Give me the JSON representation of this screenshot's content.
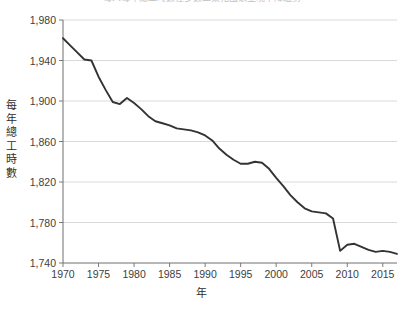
{
  "chart_data": {
    "type": "line",
    "title": "每人每年總工時數在多數工業化國家呈現下降趨勢",
    "xlabel": "年",
    "ylabel": "每年總工時數",
    "xlim": [
      1970,
      2017
    ],
    "ylim": [
      1740,
      1980
    ],
    "grid": true,
    "legend_position": "none",
    "y_ticks": [
      "1,980",
      "1,940",
      "1,900",
      "1,860",
      "1,820",
      "1,780",
      "1,740"
    ],
    "y_tick_values": [
      1980,
      1940,
      1900,
      1860,
      1820,
      1780,
      1740
    ],
    "x_ticks": [
      "1970",
      "1975",
      "1980",
      "1985",
      "1990",
      "1995",
      "2000",
      "2005",
      "2010",
      "2015"
    ],
    "x_tick_values": [
      1970,
      1975,
      1980,
      1985,
      1990,
      1995,
      2000,
      2005,
      2010,
      2015
    ],
    "line_color": "#333333",
    "grid_color": "#d9d9d9",
    "axis_color": "#7a7a7a",
    "series": [
      {
        "name": "每年總工時數",
        "x": [
          1970,
          1971,
          1972,
          1973,
          1974,
          1975,
          1976,
          1977,
          1978,
          1979,
          1980,
          1981,
          1982,
          1983,
          1984,
          1985,
          1986,
          1987,
          1988,
          1989,
          1990,
          1991,
          1992,
          1993,
          1994,
          1995,
          1996,
          1997,
          1998,
          1999,
          2000,
          2001,
          2002,
          2003,
          2004,
          2005,
          2006,
          2007,
          2008,
          2009,
          2010,
          2011,
          2012,
          2013,
          2014,
          2015,
          2016,
          2017
        ],
        "values": [
          1962,
          1955,
          1948,
          1941,
          1940,
          1924,
          1911,
          1899,
          1897,
          1903,
          1898,
          1892,
          1885,
          1880,
          1878,
          1876,
          1873,
          1872,
          1871,
          1869,
          1866,
          1861,
          1853,
          1847,
          1842,
          1838,
          1838,
          1840,
          1839,
          1833,
          1824,
          1816,
          1807,
          1800,
          1794,
          1791,
          1790,
          1789,
          1784,
          1752,
          1758,
          1759,
          1756,
          1753,
          1751,
          1752,
          1751,
          1749
        ]
      }
    ]
  }
}
